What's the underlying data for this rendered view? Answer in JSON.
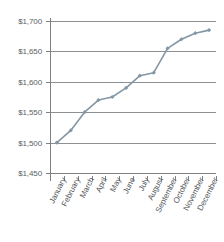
{
  "chart_data": {
    "type": "line",
    "title": "",
    "subtitle": "",
    "xlabel": "",
    "ylabel": "",
    "categories": [
      "January",
      "February",
      "March",
      "April",
      "May",
      "June",
      "July",
      "August",
      "September",
      "October",
      "November",
      "December"
    ],
    "values": [
      1500,
      1520,
      1550,
      1570,
      1575,
      1590,
      1610,
      1615,
      1655,
      1670,
      1680,
      1685
    ],
    "series": [
      {
        "name": "",
        "values": [
          1500,
          1520,
          1550,
          1570,
          1575,
          1590,
          1610,
          1615,
          1655,
          1670,
          1680,
          1685
        ]
      }
    ],
    "ylim": [
      1450,
      1700
    ],
    "ytick_values": [
      1450,
      1500,
      1550,
      1600,
      1650,
      1700
    ],
    "ytick_labels": [
      "$1,450",
      "$1,500",
      "$1,550",
      "$1,600",
      "$1,650",
      "$1,700"
    ],
    "xtick_labels": [
      "January",
      "February",
      "March",
      "April",
      "May",
      "June",
      "July",
      "August",
      "September",
      "October",
      "November",
      "December"
    ],
    "grid": true,
    "grid_axis": "y",
    "legend": false,
    "legend_position": "none",
    "marker": "diamond",
    "line_color": "#8497a5",
    "marker_color": "#8497a5",
    "grid_color": "#8d9194",
    "axis_color": "#7d8184",
    "label_color": "#55595d",
    "background_color": "#ffffff"
  }
}
